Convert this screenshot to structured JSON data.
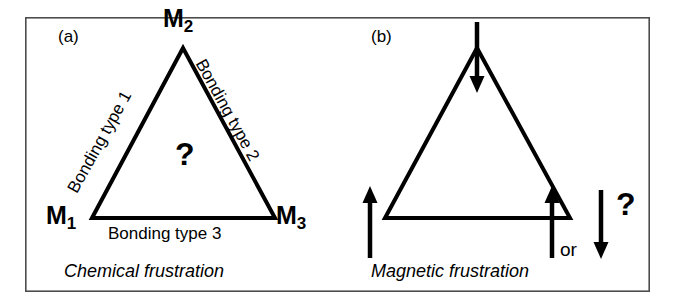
{
  "figure": {
    "background_color": "#ffffff",
    "line_color": "#000000",
    "frame": {
      "x": 25,
      "y": 17,
      "width": 625,
      "height": 275,
      "stroke_width": 1.6
    }
  },
  "panel_a": {
    "tag": "(a)",
    "caption": "Chemical frustration",
    "center_symbol": "?",
    "vertices": [
      {
        "name": "M1",
        "label_main": "M",
        "label_sub": "1",
        "x": 92,
        "y": 218
      },
      {
        "name": "M2",
        "label_main": "M",
        "label_sub": "2",
        "x": 183,
        "y": 48
      },
      {
        "name": "M3",
        "label_main": "M",
        "label_sub": "3",
        "x": 275,
        "y": 218
      }
    ],
    "edges": [
      {
        "label": "Bonding type 1",
        "from": "M1",
        "to": "M2",
        "rotation_deg": -61
      },
      {
        "label": "Bonding type 2",
        "from": "M2",
        "to": "M3",
        "rotation_deg": 61
      },
      {
        "label": "Bonding type 3",
        "from": "M1",
        "to": "M3",
        "rotation_deg": 0
      }
    ]
  },
  "panel_b": {
    "tag": "(b)",
    "caption": "Magnetic frustration",
    "center_symbol": "?",
    "or_label": "or",
    "vertices": [
      {
        "name": "bottom-left",
        "x": 385,
        "y": 218
      },
      {
        "name": "apex",
        "x": 477,
        "y": 48
      },
      {
        "name": "bottom-right",
        "x": 570,
        "y": 218
      }
    ],
    "spins": [
      {
        "name": "spin-up-bottom-left",
        "direction": "up",
        "x": 370,
        "y_top": 190,
        "y_bottom": 258
      },
      {
        "name": "spin-down-apex",
        "direction": "down",
        "x": 477,
        "y_top": 22,
        "y_bottom": 93
      },
      {
        "name": "spin-up-bottom-right",
        "direction": "up",
        "x": 552,
        "y_top": 190,
        "y_bottom": 258
      },
      {
        "name": "spin-down-alternative",
        "direction": "down",
        "x": 601,
        "y_top": 190,
        "y_bottom": 258
      }
    ]
  }
}
